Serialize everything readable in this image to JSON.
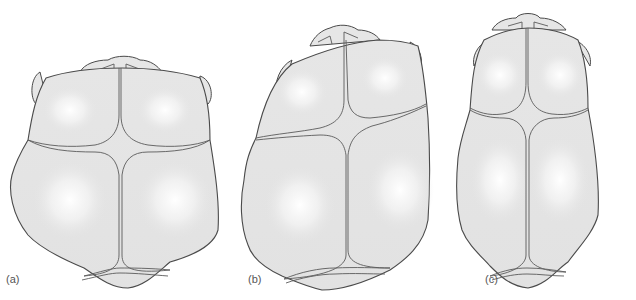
{
  "figure": {
    "panels": [
      {
        "id": "a",
        "label": "(a)",
        "shape": "broad / brachycephalic outline with wide parietal bossing"
      },
      {
        "id": "b",
        "label": "(b)",
        "shape": "asymmetric / skewed (plagiocephalic) outline"
      },
      {
        "id": "c",
        "label": "(c)",
        "shape": "long narrow / symmetrical oval outline"
      }
    ],
    "structures": [
      "frontal bones",
      "parietal bones",
      "occipital bone",
      "coronal suture",
      "sagittal suture",
      "lambdoid suture",
      "metopic suture",
      "nasal region",
      "ears"
    ]
  },
  "colors": {
    "bone_fill": "#e4e4e4",
    "bone_highlight": "#ffffff",
    "outline": "#4a4a4a",
    "label_text": "#555555",
    "background": "#ffffff"
  }
}
